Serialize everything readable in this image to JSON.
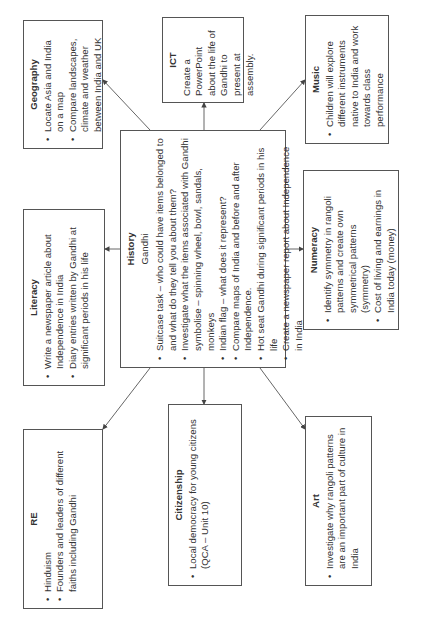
{
  "diagram": {
    "center": {
      "title": "History",
      "subtitle": "Gandhi",
      "items": [
        "Suitcase task – who could have items belonged to and what do they tell you about them?",
        "Investigate what the items associated with Gandhi symbolise – spinning wheel, bowl, sandals, monkeys",
        "Indian flag – what does it represent?",
        "Compare maps of India and before and after Independence.",
        "Hot seat Gandhi during significant periods in his life",
        "Create a newspaper report about Independence in India"
      ]
    },
    "nodes": {
      "re": {
        "title": "RE",
        "items": [
          "Hinduism",
          "Founders and leaders of different faiths including Gandhi"
        ]
      },
      "literacy": {
        "title": "Literacy",
        "items": [
          "Write a newspaper article about Independence in India",
          "Diary entries written by Gandhi at significant periods in his life"
        ]
      },
      "geography": {
        "title": "Geography",
        "items": [
          "Locate Asia and India on a map",
          "Compare landscapes, climate and weather between India and UK"
        ]
      },
      "citizenship": {
        "title": "Citizenship",
        "items": [
          "Local democracy for young citizens (QCA – Unit 10)"
        ]
      },
      "ict": {
        "title": "ICT",
        "text": "Create a PowerPoint about the life of Gandhi to present at assembly."
      },
      "art": {
        "title": "Art",
        "items": [
          "Investigate why rangoli patterns are an important part of culture in India"
        ]
      },
      "numeracy": {
        "title": "Numeracy",
        "items": [
          "Identify symmetry in rangoli patterns and create own symmetrical patterns (symmetry)",
          "Cost of living and earnings in India today (money)"
        ]
      },
      "music": {
        "title": "Music",
        "items": [
          "Children will explore different instruments native to India and work towards class performance"
        ]
      }
    }
  }
}
